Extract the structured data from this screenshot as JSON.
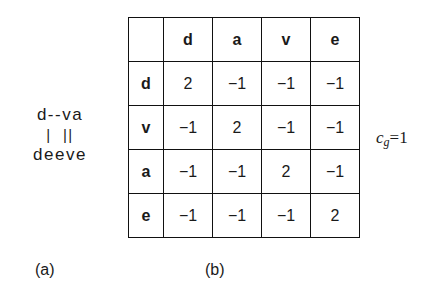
{
  "panel_a": {
    "caption": "(a)",
    "alignment": {
      "top_sequence": "d--va",
      "match_bars": "|  ||",
      "bottom_sequence": "deeve"
    }
  },
  "panel_b": {
    "caption": "(b)",
    "matrix": {
      "corner": "",
      "column_headers": [
        "d",
        "a",
        "v",
        "e"
      ],
      "row_headers": [
        "d",
        "v",
        "a",
        "e"
      ],
      "rows": [
        [
          "2",
          "−1",
          "−1",
          "−1"
        ],
        [
          "−1",
          "2",
          "−1",
          "−1"
        ],
        [
          "−1",
          "−1",
          "2",
          "−1"
        ],
        [
          "−1",
          "−1",
          "−1",
          "2"
        ]
      ]
    }
  },
  "gap_cost": {
    "symbol": "c",
    "subscript": "g",
    "equals_value": "=1"
  }
}
